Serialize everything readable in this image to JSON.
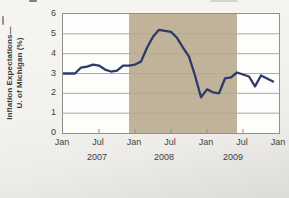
{
  "chart_data": {
    "type": "line",
    "title": "",
    "ylabel_line1": "Inflation Expectations—",
    "ylabel_line2": "U. of Michigan (%)",
    "ylim": [
      0,
      6
    ],
    "yticks": [
      6,
      5,
      4,
      3,
      2,
      1,
      0
    ],
    "xtick_labels": [
      "Jan",
      "Jul",
      "Jan",
      "Jul",
      "Jan",
      "Jul",
      "Jan"
    ],
    "year_labels": [
      "2007",
      "2008",
      "2009"
    ],
    "x_range": {
      "start": "Jan 2007",
      "end": "Jan 2010",
      "total_months": 36
    },
    "grid": true,
    "line_color": "#2f3a68",
    "plot_bg_color": "#fdfdfc",
    "recession_band": {
      "start_month_index": 11,
      "end_month_index": 29,
      "color": "#c0b39a"
    },
    "series": [
      {
        "name": "Inflation Expectations — U. of Michigan (%)",
        "start": "Jan 2007",
        "frequency": "monthly",
        "values": [
          3.0,
          3.0,
          3.0,
          3.3,
          3.35,
          3.45,
          3.4,
          3.2,
          3.1,
          3.15,
          3.4,
          3.4,
          3.45,
          3.6,
          4.3,
          4.85,
          5.2,
          5.15,
          5.1,
          4.8,
          4.3,
          3.85,
          2.9,
          1.8,
          2.2,
          2.05,
          2.0,
          2.75,
          2.8,
          3.05,
          2.95,
          2.85,
          2.35,
          2.9,
          2.75,
          2.6
        ]
      }
    ]
  }
}
